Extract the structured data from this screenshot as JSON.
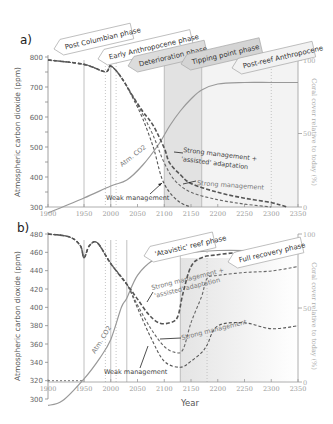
{
  "chart_data": [
    {
      "type": "line",
      "panel_label": "a)",
      "title": "",
      "xlabel": "",
      "ylabel": "Atmospheric carbon dioxide (ppm)",
      "ylabel_right": "Coral cover relative to today (%)",
      "xlim": [
        1900,
        2350
      ],
      "ylim": [
        300,
        800
      ],
      "ylim_right": [
        0,
        100
      ],
      "x_ticks": [
        "1900",
        "1950",
        "2000",
        "2050",
        "2100",
        "2150",
        "2200",
        "2250",
        "2300",
        "2350"
      ],
      "y_ticks": [
        "300",
        "400",
        "500",
        "600",
        "700",
        "800"
      ],
      "y_ticks_right": [
        "0",
        "50",
        "100"
      ],
      "phases": [
        {
          "label": "Post Columbian phase",
          "start": 1900,
          "end": 1950
        },
        {
          "label": "Early  Anthropocene phase",
          "start": 1950,
          "end": 2000
        },
        {
          "label": "Deterioration phase",
          "start": 2000,
          "end": 2100
        },
        {
          "label": "Tipping point phase",
          "start": 2100,
          "end": 2170
        },
        {
          "label": "Post-reef Anthropocene",
          "start": 2170,
          "end": 2350
        }
      ],
      "series": [
        {
          "name": "Atm. CO2",
          "axis": "left",
          "style": "solid",
          "x": [
            1900,
            1950,
            2000,
            2030,
            2060,
            2090,
            2110,
            2130,
            2150,
            2170,
            2200,
            2250,
            2300,
            2350
          ],
          "y": [
            280,
            330,
            370,
            390,
            440,
            510,
            570,
            620,
            660,
            690,
            710,
            715,
            715,
            715
          ]
        },
        {
          "name": "Weak management",
          "axis": "right",
          "style": "dashed",
          "x": [
            1900,
            1950,
            1990,
            2000,
            2020,
            2040,
            2060,
            2080,
            2095,
            2110,
            2130,
            2150
          ],
          "y": [
            100,
            97,
            92,
            96,
            88,
            75,
            60,
            40,
            20,
            10,
            3,
            0
          ]
        },
        {
          "name": "Strong management",
          "axis": "right",
          "style": "dashed",
          "x": [
            1900,
            1950,
            1990,
            2000,
            2020,
            2040,
            2060,
            2080,
            2100,
            2120,
            2150,
            2200,
            2250,
            2300
          ],
          "y": [
            100,
            97,
            92,
            96,
            88,
            76,
            63,
            48,
            30,
            18,
            10,
            5,
            2,
            0
          ]
        },
        {
          "name": "Strong management + 'assisted' adaptation",
          "axis": "right",
          "style": "dashed",
          "x": [
            1900,
            1950,
            1990,
            2000,
            2020,
            2040,
            2060,
            2080,
            2100,
            2110,
            2130,
            2150,
            2200,
            2250,
            2300,
            2330
          ],
          "y": [
            100,
            97,
            92,
            96,
            88,
            76,
            65,
            55,
            40,
            30,
            22,
            16,
            10,
            6,
            3,
            0
          ]
        }
      ],
      "annotations": [
        {
          "text": "Atm. CO2"
        },
        {
          "text": "Weak management"
        },
        {
          "text": "Strong management"
        },
        {
          "text": "Strong management + 'assisted' adaptation"
        }
      ]
    },
    {
      "type": "line",
      "panel_label": "b)",
      "title": "",
      "xlabel": "Year",
      "ylabel": "Atmospheric carbon dioxide (ppm)",
      "ylabel_right": "Coral cover relative to today (%)",
      "xlim": [
        1900,
        2350
      ],
      "ylim": [
        300,
        480
      ],
      "ylim_right": [
        0,
        100
      ],
      "x_ticks": [
        "1900",
        "1950",
        "2000",
        "2050",
        "2100",
        "2150",
        "2200",
        "2250",
        "2300",
        "2350"
      ],
      "y_ticks": [
        "300",
        "320",
        "340",
        "360",
        "380",
        "400",
        "420",
        "440",
        "460",
        "480"
      ],
      "y_ticks_right": [
        "0",
        "50",
        "100"
      ],
      "phases": [
        {
          "label": "'Atavistic' reef phase",
          "start": 2130,
          "end": 2180
        },
        {
          "label": "Full recovery phase",
          "start": 2180,
          "end": 2350
        }
      ],
      "series": [
        {
          "name": "Atm. CO2",
          "axis": "left",
          "style": "solid",
          "x": [
            1900,
            1920,
            1950,
            1980,
            2000,
            2020,
            2030,
            2050,
            2080,
            2100,
            2130,
            2150,
            2200,
            2250,
            2300,
            2350
          ],
          "y": [
            293,
            298,
            322,
            345,
            365,
            400,
            410,
            435,
            452,
            455,
            458,
            460,
            462,
            462,
            461,
            460
          ]
        },
        {
          "name": "Weak management",
          "axis": "right",
          "style": "dashed",
          "x": [
            1900,
            1930,
            1945,
            1950,
            1960,
            1975,
            2000,
            2030,
            2050,
            2075,
            2100,
            2130,
            2150,
            2170,
            2180,
            2200,
            2250,
            2300,
            2350
          ],
          "y": [
            100,
            98,
            92,
            84,
            92,
            94,
            80,
            66,
            50,
            30,
            14,
            10,
            14,
            20,
            25,
            38,
            40,
            36,
            38
          ]
        },
        {
          "name": "Strong management",
          "axis": "right",
          "style": "dashed",
          "x": [
            1900,
            1930,
            1945,
            1950,
            1960,
            1975,
            2000,
            2030,
            2050,
            2075,
            2100,
            2120,
            2135,
            2150,
            2170,
            2180,
            2200,
            2250,
            2300,
            2350
          ],
          "y": [
            100,
            98,
            92,
            84,
            92,
            94,
            80,
            66,
            52,
            36,
            24,
            20,
            22,
            40,
            58,
            70,
            72,
            74,
            75,
            78
          ]
        },
        {
          "name": "Strong management + 'assisted' adaptation",
          "axis": "right",
          "style": "dashed",
          "x": [
            1900,
            1930,
            1945,
            1950,
            1960,
            1975,
            2000,
            2030,
            2050,
            2070,
            2090,
            2110,
            2125,
            2135,
            2150,
            2170,
            2200,
            2250,
            2300,
            2350
          ],
          "y": [
            100,
            98,
            92,
            84,
            92,
            94,
            80,
            66,
            56,
            46,
            40,
            40,
            44,
            60,
            78,
            84,
            86,
            88,
            90,
            92
          ]
        }
      ],
      "annotations": [
        {
          "text": "Atm. CO2"
        },
        {
          "text": "Weak management"
        },
        {
          "text": "Strong management"
        },
        {
          "text": "Strong management + 'assisted' adaptation"
        }
      ]
    }
  ],
  "labels": {
    "a": {
      "panel": "a)",
      "ylabel": "Atmospheric carbon dioxide (ppm)",
      "ylabel_right": "Coral cover  relative to today (%)",
      "co2": "Atm. CO2",
      "weak": "Weak management",
      "strong": "Strong management",
      "assisted1": "Strong management +",
      "assisted2": "'assisted' adaptation",
      "phase1": "Post Columbian phase",
      "phase2": "Early  Anthropocene phase",
      "phase3": "Deterioration phase",
      "phase4": "Tipping point phase",
      "phase5": "Post-reef Anthropocene"
    },
    "b": {
      "panel": "b)",
      "ylabel": "Atmospheric carbon dioxide (ppm)",
      "ylabel_right": "Coral cover  relative to today (%)",
      "xlabel": "Year",
      "co2": "Atm. CO2",
      "weak": "Weak management",
      "strong": "Strong management",
      "assisted1": "Strong management +",
      "assisted2": "'assisted' adaptation",
      "phase1": "'Atavistic' reef phase",
      "phase2": "Full recovery phase"
    }
  }
}
